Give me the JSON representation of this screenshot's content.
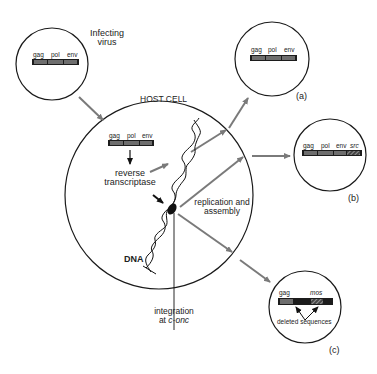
{
  "colors": {
    "line": "#1a1a1a",
    "arrow": "#7a7a7a",
    "bar_dark": "#1c1c1c",
    "bar_segment": "#6e6e6e"
  },
  "infecting_virus": {
    "label_line1": "Infecting",
    "label_line2": "virus",
    "genes": [
      "gag",
      "pol",
      "env"
    ]
  },
  "host_cell": {
    "title": "HOST CELL",
    "genes": [
      "gag",
      "pol",
      "env"
    ],
    "reverse_line1": "reverse",
    "reverse_line2": "transcriptase",
    "replication_line1": "replication and",
    "replication_line2": "assembly",
    "dna_label": "DNA",
    "integration_line1": "integration",
    "integration_line2_prefix": "at ",
    "integration_line2_italic": "c-onc"
  },
  "outcomes": [
    {
      "id": "a",
      "label": "(a)",
      "genes": [
        "gag",
        "pol",
        "env"
      ]
    },
    {
      "id": "b",
      "label": "(b)",
      "genes": [
        "gag",
        "pol",
        "env",
        "src"
      ]
    },
    {
      "id": "c",
      "label": "(c)",
      "genes": [
        "gag",
        "mos"
      ],
      "note": "deleted sequences"
    }
  ]
}
